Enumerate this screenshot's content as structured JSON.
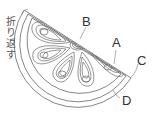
{
  "diagram": {
    "stroke_color": "#555555",
    "labels": {
      "A": "A",
      "B": "B",
      "C": "C",
      "D": "D"
    },
    "side_text": "折り返す",
    "segments": 5
  }
}
